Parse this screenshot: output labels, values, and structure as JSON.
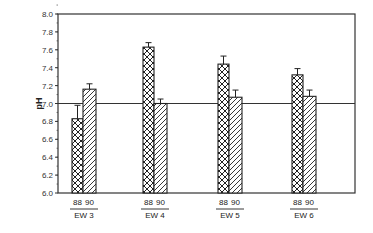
{
  "chart_data": {
    "type": "bar",
    "title": "",
    "xlabel": "",
    "ylabel": "pH",
    "ylim": [
      6.0,
      8.0
    ],
    "yticks": [
      "6.0",
      "6.2",
      "6.4",
      "6.6",
      "6.8",
      "7.0",
      "7.2",
      "7.4",
      "7.6",
      "7.8",
      "8.0"
    ],
    "reference_line": 7.0,
    "grid": false,
    "legend": null,
    "categories": [
      "EW 3",
      "EW 4",
      "EW 5",
      "EW 6"
    ],
    "series": [
      {
        "name": "88",
        "pattern": "crosshatch",
        "values": [
          6.83,
          7.63,
          7.44,
          7.32
        ],
        "error_upper": [
          6.98,
          7.68,
          7.53,
          7.39
        ]
      },
      {
        "name": "90",
        "pattern": "diagonal",
        "values": [
          7.16,
          7.0,
          7.07,
          7.08
        ],
        "error_upper": [
          7.22,
          7.05,
          7.15,
          7.15
        ]
      }
    ]
  }
}
